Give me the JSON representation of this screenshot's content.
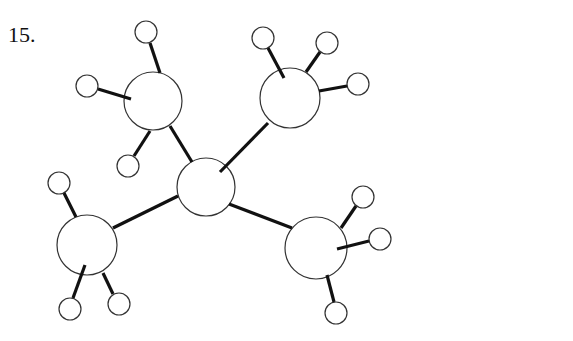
{
  "problem_label": "15.",
  "molecule": {
    "description": "Ball-and-stick model: central carbon bonded to four methyl groups (neopentane, C5H12)",
    "central_atom": {
      "element": "C",
      "x": 206,
      "y": 187,
      "r": 29
    },
    "groups": [
      {
        "name": "methyl-top-left",
        "carbon": {
          "x": 153,
          "y": 101,
          "r": 29
        },
        "bond_to_center": [
          170,
          126,
          192,
          162
        ],
        "hydrogens": [
          {
            "x": 146,
            "y": 32,
            "r": 11,
            "bond": [
              150,
              43,
              160,
              73
            ]
          },
          {
            "x": 87,
            "y": 86,
            "r": 11,
            "bond": [
              98,
              89,
              131,
              99
            ]
          },
          {
            "x": 128,
            "y": 166,
            "r": 11,
            "bond": [
              134,
              156,
              150,
              131
            ]
          }
        ]
      },
      {
        "name": "methyl-top-right",
        "carbon": {
          "x": 290,
          "y": 98,
          "r": 30
        },
        "bond_to_center": [
          220,
          172,
          268,
          123
        ],
        "hydrogens": [
          {
            "x": 263,
            "y": 38,
            "r": 11,
            "bond": [
              268,
              48,
              284,
              78
            ]
          },
          {
            "x": 327,
            "y": 43,
            "r": 11,
            "bond": [
              320,
              52,
              306,
              72
            ]
          },
          {
            "x": 358,
            "y": 84,
            "r": 11,
            "bond": [
              347,
              86,
              319,
              91
            ]
          }
        ]
      },
      {
        "name": "methyl-bottom-left",
        "carbon": {
          "x": 87,
          "y": 245,
          "r": 30
        },
        "bond_to_center": [
          113,
          228,
          178,
          196
        ],
        "hydrogens": [
          {
            "x": 59,
            "y": 183,
            "r": 11,
            "bond": [
              64,
              193,
              76,
              217
            ]
          },
          {
            "x": 70,
            "y": 309,
            "r": 11,
            "bond": [
              73,
              298,
              85,
              265
            ]
          },
          {
            "x": 119,
            "y": 304,
            "r": 11,
            "bond": [
              113,
              294,
              103,
              273
            ]
          }
        ]
      },
      {
        "name": "methyl-bottom-right",
        "carbon": {
          "x": 316,
          "y": 248,
          "r": 31
        },
        "bond_to_center": [
          229,
          204,
          292,
          228
        ],
        "hydrogens": [
          {
            "x": 363,
            "y": 197,
            "r": 11,
            "bond": [
              356,
              206,
              341,
              228
            ]
          },
          {
            "x": 380,
            "y": 239,
            "r": 11,
            "bond": [
              369,
              241,
              337,
              249
            ]
          },
          {
            "x": 336,
            "y": 313,
            "r": 11,
            "bond": [
              334,
              302,
              327,
              275
            ]
          }
        ]
      }
    ]
  }
}
